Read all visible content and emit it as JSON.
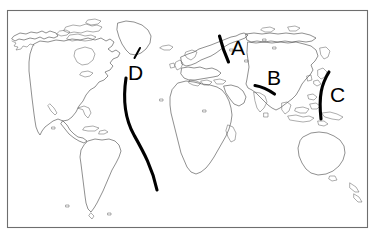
{
  "figure": {
    "background_color": "#ffffff",
    "border_color": "#6e6e6e",
    "coastline_color": "#4a4a4a",
    "marker_color": "#000000",
    "frame": {
      "x": 7,
      "y": 10,
      "width": 360,
      "height": 217
    }
  },
  "markers": [
    {
      "id": "A",
      "label": "A",
      "label_x": 231,
      "label_y": 55,
      "description": "short curved line over western Russia / Ural region",
      "path": "M 219.5 36 C 221.5 44, 224 52, 228.5 62",
      "tick": null
    },
    {
      "id": "B",
      "label": "B",
      "label_x": 267,
      "label_y": 85,
      "description": "short diagonal line over central Asia",
      "path": "M 255 85.5 C 261 86.5, 268 89.5, 274.5 94",
      "tick": null
    },
    {
      "id": "C",
      "label": "C",
      "label_x": 330,
      "label_y": 102,
      "description": "long left-bowing arc off the east Asian coast",
      "path": "M 329 72 C 321.5 84, 318.5 96, 321 119",
      "tick": null
    },
    {
      "id": "D",
      "label": "D",
      "label_x": 128,
      "label_y": 80,
      "description": "long S-curve running down the Atlantic Ocean",
      "path": "M 126 78 C 123 98, 124.5 118, 134 135 C 143.5 152, 152.5 168, 157 190",
      "tick": "M 140 48 L 134.5 58"
    }
  ],
  "map_regions": [
    "North America",
    "Greenland",
    "South America",
    "Europe",
    "Africa",
    "Asia",
    "Australia",
    "New Zealand",
    "Japan",
    "Indonesia",
    "Madagascar",
    "British Isles",
    "Iceland"
  ]
}
